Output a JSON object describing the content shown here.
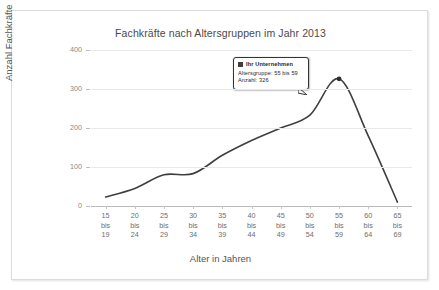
{
  "chart_data": {
    "type": "line",
    "title": "Fachkräfte nach Altersgruppen im Jahr 2013",
    "xlabel": "Alter in Jahren",
    "ylabel": "Anzahl Fachkräfte",
    "categories": [
      "15 bis 19",
      "20 bis 24",
      "25 bis 29",
      "30 bis 34",
      "35 bis 39",
      "40 bis 44",
      "45 bis 49",
      "50 bis 54",
      "55 bis 59",
      "60 bis 64",
      "65 bis 69"
    ],
    "category_lines": [
      [
        "15",
        "bis",
        "19"
      ],
      [
        "20",
        "bis",
        "24"
      ],
      [
        "25",
        "bis",
        "29"
      ],
      [
        "30",
        "bis",
        "34"
      ],
      [
        "35",
        "bis",
        "39"
      ],
      [
        "40",
        "bis",
        "44"
      ],
      [
        "45",
        "bis",
        "49"
      ],
      [
        "50",
        "bis",
        "54"
      ],
      [
        "55",
        "bis",
        "59"
      ],
      [
        "60",
        "bis",
        "64"
      ],
      [
        "65",
        "bis",
        "69"
      ]
    ],
    "series": [
      {
        "name": "Ihr Unternehmen",
        "color": "#3f3f3f",
        "values": [
          23,
          45,
          80,
          83,
          130,
          168,
          200,
          233,
          326,
          180,
          10
        ]
      }
    ],
    "ylim": [
      0,
      400
    ],
    "yticks": [
      400,
      300,
      200,
      100,
      0
    ],
    "grid": true,
    "legend": "none",
    "highlight_point": {
      "category": "55 bis 59",
      "value": 326
    }
  },
  "tooltip": {
    "header": "Ihr Unternehmen",
    "row_age": "Altersgruppe: 55 bis 59",
    "row_count": "Anzahl: 326"
  },
  "colors": {
    "line": "#3f3f3f",
    "grid": "#e8e8e8",
    "axis": "#b9b9b9",
    "title_text": "#4a4a4a",
    "tick_text": "#6d6d6d",
    "frame_border": "#dcdcdc"
  }
}
